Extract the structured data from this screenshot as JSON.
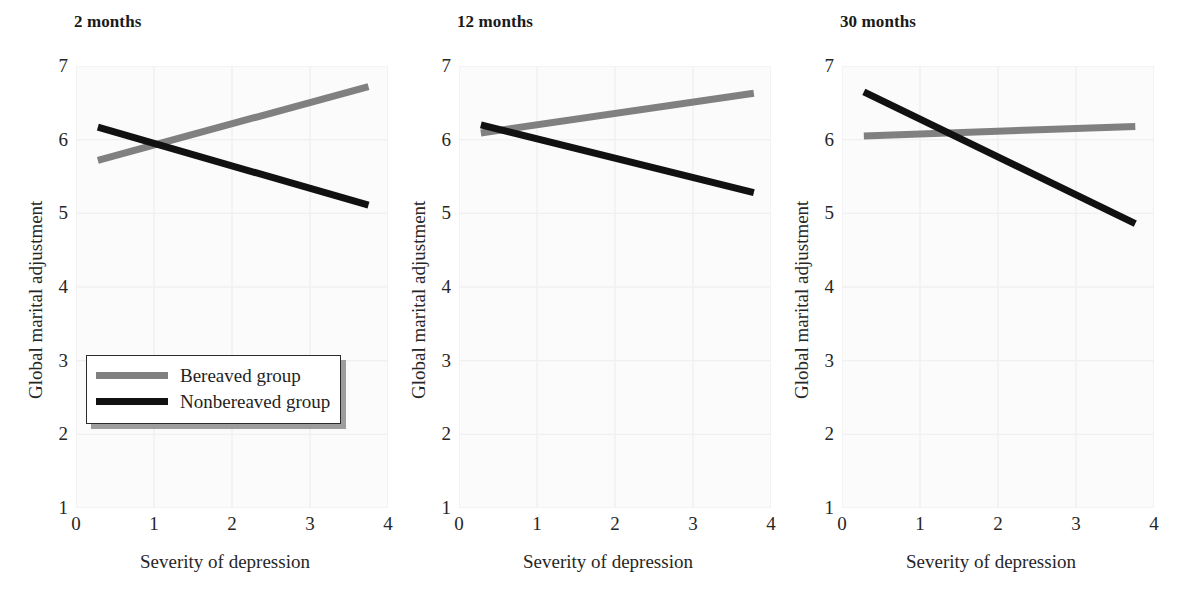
{
  "figure": {
    "background": "#ffffff",
    "plot_background": "#fbfbfb",
    "grid_color": "#f0f0f0"
  },
  "colors": {
    "bereaved": "#808080",
    "nonbereaved": "#111111",
    "axis_text": "#262626",
    "title_text": "#1a1a1a"
  },
  "legend": {
    "position": "inside-bottom-left-panel-1",
    "entries": [
      {
        "label": "Bereaved group",
        "color": "#808080"
      },
      {
        "label": "Nonbereaved group",
        "color": "#111111"
      }
    ]
  },
  "axes": {
    "xlabel": "Severity of depression",
    "ylabel": "Global marital adjustment",
    "xticks": [
      "0",
      "1",
      "2",
      "3",
      "4"
    ],
    "yticks": [
      "1",
      "2",
      "3",
      "4",
      "5",
      "6",
      "7"
    ],
    "xlim": [
      0,
      4
    ],
    "ylim": [
      1,
      7
    ],
    "grid": true
  },
  "chart_data": [
    {
      "type": "line",
      "title": "2 months",
      "xlabel": "Severity of depression",
      "ylabel": "Global marital adjustment",
      "xlim": [
        0,
        4
      ],
      "ylim": [
        1,
        7
      ],
      "xticks": [
        0,
        1,
        2,
        3,
        4
      ],
      "yticks": [
        1,
        2,
        3,
        4,
        5,
        6,
        7
      ],
      "grid": true,
      "legend_position": "lower left",
      "x": [
        0.28,
        3.75
      ],
      "series": [
        {
          "name": "Bereaved group",
          "color": "#808080",
          "values": [
            5.72,
            6.72
          ]
        },
        {
          "name": "Nonbereaved group",
          "color": "#111111",
          "values": [
            6.17,
            5.11
          ]
        }
      ],
      "crossing_point": {
        "x": 1.0,
        "y": 5.95
      }
    },
    {
      "type": "line",
      "title": "12 months",
      "xlabel": "Severity of depression",
      "ylabel": "Global marital adjustment",
      "xlim": [
        0,
        4
      ],
      "ylim": [
        1,
        7
      ],
      "xticks": [
        0,
        1,
        2,
        3,
        4
      ],
      "yticks": [
        1,
        2,
        3,
        4,
        5,
        6,
        7
      ],
      "grid": true,
      "legend_position": "none",
      "x": [
        0.28,
        3.78
      ],
      "series": [
        {
          "name": "Bereaved group",
          "color": "#808080",
          "values": [
            6.09,
            6.63
          ]
        },
        {
          "name": "Nonbereaved group",
          "color": "#111111",
          "values": [
            6.2,
            5.28
          ]
        }
      ],
      "crossing_point": {
        "x": 0.55,
        "y": 6.13
      }
    },
    {
      "type": "line",
      "title": "30 months",
      "xlabel": "Severity of depression",
      "ylabel": "Global marital adjustment",
      "xlim": [
        0,
        4
      ],
      "ylim": [
        1,
        7
      ],
      "xticks": [
        0,
        1,
        2,
        3,
        4
      ],
      "yticks": [
        1,
        2,
        3,
        4,
        5,
        6,
        7
      ],
      "grid": true,
      "legend_position": "none",
      "x": [
        0.28,
        3.76
      ],
      "series": [
        {
          "name": "Bereaved group",
          "color": "#808080",
          "values": [
            6.05,
            6.18
          ]
        },
        {
          "name": "Nonbereaved group",
          "color": "#111111",
          "values": [
            6.65,
            4.86
          ]
        }
      ],
      "crossing_point": {
        "x": 1.4,
        "y": 6.09
      }
    }
  ],
  "panels": [
    {
      "title": "2 months"
    },
    {
      "title": "12 months"
    },
    {
      "title": "30 months"
    }
  ]
}
